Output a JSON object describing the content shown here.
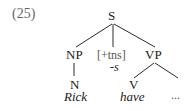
{
  "example": {
    "number": "(25)"
  },
  "tree": {
    "root": {
      "label": "S"
    },
    "children": [
      {
        "label": "NP",
        "child": {
          "label": "N",
          "word": "Rick"
        }
      },
      {
        "label": "[+tns]",
        "word": "-s"
      },
      {
        "label": "VP",
        "children": [
          {
            "label": "V",
            "word": "have"
          },
          {
            "label": "...",
            "placeholder": true
          }
        ]
      }
    ]
  }
}
